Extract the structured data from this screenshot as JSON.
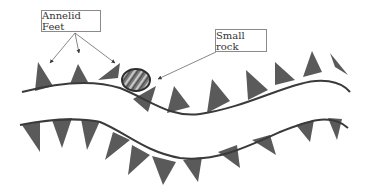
{
  "diagram": {
    "labels": {
      "feet": "Annelid Feet",
      "rock": "Small rock"
    },
    "colors": {
      "foot_fill": "#5a5a5a",
      "body_outline": "#3a3a3a",
      "arrow": "#6a6a6a",
      "label_border": "#8a8a8a"
    }
  }
}
